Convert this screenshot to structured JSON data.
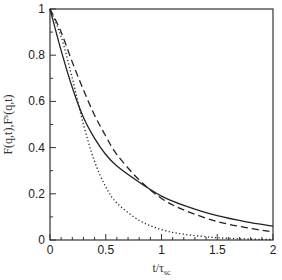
{
  "chart_data": {
    "type": "line",
    "title": "",
    "xlabel": "t/τsc",
    "xlabel_main": "t/τ",
    "xlabel_sub": "sc",
    "ylabel": "F(q,t),F^s(q,t)",
    "ylabel_main": "F(q,t),F",
    "ylabel_sup": "s",
    "ylabel_tail": "(q,t)",
    "xlim": [
      0,
      2
    ],
    "ylim": [
      0,
      1
    ],
    "xticks": [
      0,
      0.5,
      1,
      1.5,
      2
    ],
    "xtick_labels": [
      "0",
      "0.5",
      "1",
      "1.5",
      "2"
    ],
    "yticks": [
      0,
      0.2,
      0.4,
      0.6,
      0.8,
      1
    ],
    "ytick_labels": [
      "0",
      "0.2",
      "0.4",
      "0.6",
      "0.8",
      "1"
    ],
    "grid": false,
    "legend": null,
    "series": [
      {
        "name": "solid",
        "style": "solid",
        "x": [
          0,
          0.1,
          0.2,
          0.3,
          0.4,
          0.5,
          0.6,
          0.8,
          1.0,
          1.2,
          1.5,
          1.8,
          2.0
        ],
        "values": [
          1.0,
          0.82,
          0.66,
          0.53,
          0.44,
          0.37,
          0.32,
          0.25,
          0.19,
          0.15,
          0.105,
          0.075,
          0.06
        ]
      },
      {
        "name": "dashed",
        "style": "dashed",
        "x": [
          0,
          0.1,
          0.2,
          0.3,
          0.4,
          0.5,
          0.6,
          0.8,
          1.0,
          1.2,
          1.5,
          1.8,
          2.0
        ],
        "values": [
          1.0,
          0.9,
          0.77,
          0.65,
          0.54,
          0.45,
          0.37,
          0.26,
          0.18,
          0.13,
          0.08,
          0.05,
          0.035
        ]
      },
      {
        "name": "dotted",
        "style": "dotted",
        "x": [
          0,
          0.1,
          0.2,
          0.3,
          0.4,
          0.5,
          0.6,
          0.8,
          1.0,
          1.2,
          1.5,
          1.8,
          2.0
        ],
        "values": [
          1.0,
          0.88,
          0.7,
          0.5,
          0.34,
          0.23,
          0.16,
          0.085,
          0.045,
          0.025,
          0.01,
          0.004,
          0.002
        ]
      }
    ]
  },
  "layout": {
    "plot_left": 50,
    "plot_right": 273,
    "plot_top": 9,
    "plot_bottom": 240,
    "line_color": "#222222"
  }
}
